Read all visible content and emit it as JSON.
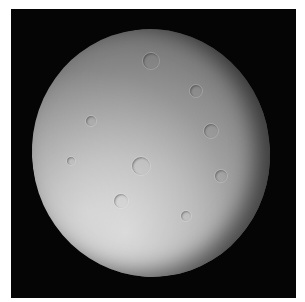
{
  "image": {
    "subject": "cratered moon",
    "background_color": "#050505",
    "border_color": "#ffffff",
    "moon_colors": [
      "#cfcfcf",
      "#9a9a9a",
      "#6d6d6d",
      "#3a3a3a"
    ],
    "craters": [
      {
        "x": 150,
        "y": 60,
        "r": 8
      },
      {
        "x": 195,
        "y": 90,
        "r": 6
      },
      {
        "x": 210,
        "y": 130,
        "r": 7
      },
      {
        "x": 140,
        "y": 165,
        "r": 9
      },
      {
        "x": 90,
        "y": 120,
        "r": 5
      },
      {
        "x": 220,
        "y": 175,
        "r": 6
      },
      {
        "x": 120,
        "y": 200,
        "r": 7
      },
      {
        "x": 185,
        "y": 215,
        "r": 5
      },
      {
        "x": 70,
        "y": 160,
        "r": 4
      }
    ]
  }
}
